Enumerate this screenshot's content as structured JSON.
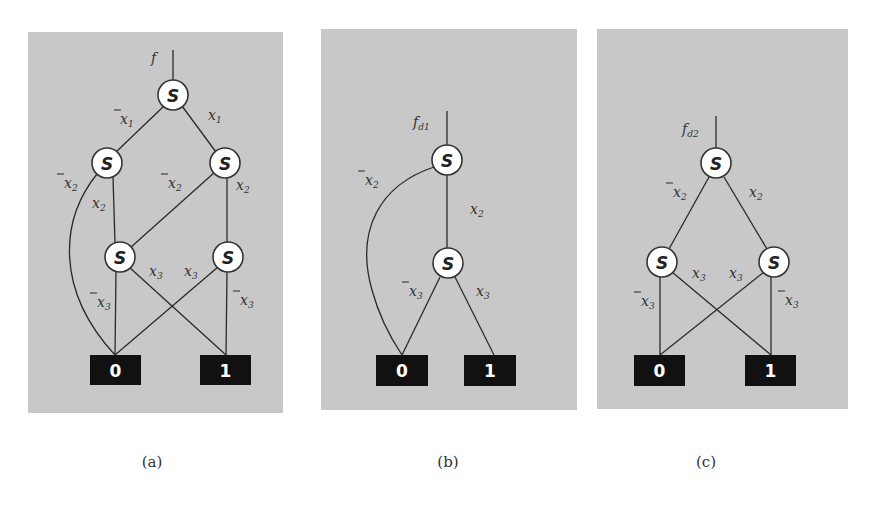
{
  "figure": {
    "panels": [
      {
        "id": "a",
        "caption": "(a)",
        "function_label": {
          "base": "f",
          "sub": ""
        },
        "bg": {
          "x": 28,
          "y": 32,
          "w": 255,
          "h": 381
        },
        "nodes": [
          {
            "id": "a_root",
            "label": "S",
            "x": 173,
            "y": 95
          },
          {
            "id": "a_l2",
            "label": "S",
            "x": 107,
            "y": 163
          },
          {
            "id": "a_r2",
            "label": "S",
            "x": 225,
            "y": 163
          },
          {
            "id": "a_l3",
            "label": "S",
            "x": 120,
            "y": 257
          },
          {
            "id": "a_r3",
            "label": "S",
            "x": 228,
            "y": 257
          }
        ],
        "terminals": [
          {
            "id": "a_t0",
            "label": "0",
            "x": 90,
            "y": 355,
            "w": 51,
            "h": 30
          },
          {
            "id": "a_t1",
            "label": "1",
            "x": 200,
            "y": 355,
            "w": 51,
            "h": 30
          }
        ],
        "edges": [
          {
            "from": "a_root",
            "to": "a_l2",
            "label": "x1",
            "negated": true
          },
          {
            "from": "a_root",
            "to": "a_r2",
            "label": "x1",
            "negated": false
          },
          {
            "from": "a_l2",
            "to": "a_t0",
            "label": "x2",
            "negated": true,
            "curved": true
          },
          {
            "from": "a_l2",
            "to": "a_l3",
            "label": "x2",
            "negated": false
          },
          {
            "from": "a_r2",
            "to": "a_l3",
            "label": "x2",
            "negated": true
          },
          {
            "from": "a_r2",
            "to": "a_r3",
            "label": "x2",
            "negated": false
          },
          {
            "from": "a_l3",
            "to": "a_t0",
            "label": "x3",
            "negated": true
          },
          {
            "from": "a_l3",
            "to": "a_t1",
            "label": "x3",
            "negated": false
          },
          {
            "from": "a_r3",
            "to": "a_t0",
            "label": "x3",
            "negated": false
          },
          {
            "from": "a_r3",
            "to": "a_t1",
            "label": "x3",
            "negated": true
          }
        ]
      },
      {
        "id": "b",
        "caption": "(b)",
        "function_label": {
          "base": "f",
          "sub": "d1"
        },
        "bg": {
          "x": 321,
          "y": 29,
          "w": 256,
          "h": 381
        },
        "nodes": [
          {
            "id": "b_root",
            "label": "S",
            "x": 447,
            "y": 160
          },
          {
            "id": "b_mid",
            "label": "S",
            "x": 448,
            "y": 263
          }
        ],
        "terminals": [
          {
            "id": "b_t0",
            "label": "0",
            "x": 376,
            "y": 355,
            "w": 52,
            "h": 31
          },
          {
            "id": "b_t1",
            "label": "1",
            "x": 464,
            "y": 355,
            "w": 52,
            "h": 31
          }
        ],
        "edges": [
          {
            "from": "b_root",
            "to": "b_t0",
            "label": "x2",
            "negated": true,
            "curved": true
          },
          {
            "from": "b_root",
            "to": "b_mid",
            "label": "x2",
            "negated": false
          },
          {
            "from": "b_mid",
            "to": "b_t0",
            "label": "x3",
            "negated": true
          },
          {
            "from": "b_mid",
            "to": "b_t1",
            "label": "x3",
            "negated": false
          }
        ]
      },
      {
        "id": "c",
        "caption": "(c)",
        "function_label": {
          "base": "f",
          "sub": "d2"
        },
        "bg": {
          "x": 597,
          "y": 29,
          "w": 251,
          "h": 380
        },
        "nodes": [
          {
            "id": "c_root",
            "label": "S",
            "x": 716,
            "y": 163
          },
          {
            "id": "c_l",
            "label": "S",
            "x": 662,
            "y": 262
          },
          {
            "id": "c_r",
            "label": "S",
            "x": 774,
            "y": 262
          }
        ],
        "terminals": [
          {
            "id": "c_t0",
            "label": "0",
            "x": 634,
            "y": 355,
            "w": 51,
            "h": 31
          },
          {
            "id": "c_t1",
            "label": "1",
            "x": 745,
            "y": 355,
            "w": 51,
            "h": 31
          }
        ],
        "edges": [
          {
            "from": "c_root",
            "to": "c_l",
            "label": "x2",
            "negated": true
          },
          {
            "from": "c_root",
            "to": "c_r",
            "label": "x2",
            "negated": false
          },
          {
            "from": "c_l",
            "to": "c_t0",
            "label": "x3",
            "negated": true
          },
          {
            "from": "c_l",
            "to": "c_t1",
            "label": "x3",
            "negated": false
          },
          {
            "from": "c_r",
            "to": "c_t0",
            "label": "x3",
            "negated": false
          },
          {
            "from": "c_r",
            "to": "c_t1",
            "label": "x3",
            "negated": true
          }
        ]
      }
    ],
    "labels": {
      "a_f": "f",
      "a_x1n": "x",
      "a_x1n_sub": "1",
      "a_x1p": "x",
      "a_x1p_sub": "1",
      "a_x2n_l": "x",
      "a_x2n_l_sub": "2",
      "a_x2p_l": "x",
      "a_x2p_l_sub": "2",
      "a_x2n_r": "x",
      "a_x2n_r_sub": "2",
      "a_x2p_r": "x",
      "a_x2p_r_sub": "2",
      "a_x3n_l": "x",
      "a_x3n_l_sub": "3",
      "a_x3p_l": "x",
      "a_x3p_l_sub": "3",
      "a_x3p_r": "x",
      "a_x3p_r_sub": "3",
      "a_x3n_r": "x",
      "a_x3n_r_sub": "3",
      "b_f": "f",
      "b_f_sub": "d1",
      "b_x2n": "x",
      "b_x2n_sub": "2",
      "b_x2p": "x",
      "b_x2p_sub": "2",
      "b_x3n": "x",
      "b_x3n_sub": "3",
      "b_x3p": "x",
      "b_x3p_sub": "3",
      "c_f": "f",
      "c_f_sub": "d2",
      "c_x2n": "x",
      "c_x2n_sub": "2",
      "c_x2p": "x",
      "c_x2p_sub": "2",
      "c_x3n_l": "x",
      "c_x3n_l_sub": "3",
      "c_x3p_l": "x",
      "c_x3p_l_sub": "3",
      "c_x3p_r": "x",
      "c_x3p_r_sub": "3",
      "c_x3n_r": "x",
      "c_x3n_r_sub": "3",
      "node": "S",
      "zero": "0",
      "one": "1"
    },
    "captions": {
      "a": "(a)",
      "b": "(b)",
      "c": "(c)"
    },
    "colors": {
      "panel_bg": "#c8c8c8",
      "terminal_bg": "#111111",
      "node_fill": "#ffffff",
      "edge": "#2a2a2a"
    }
  }
}
